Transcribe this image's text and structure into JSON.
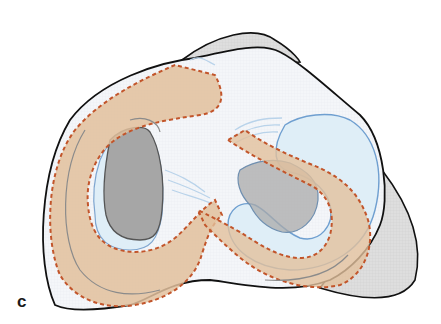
{
  "figure": {
    "panel_label": "c",
    "colors": {
      "background": "#ffffff",
      "plateau_fill": "#f3f6fa",
      "outline": "#111111",
      "posterior_shadow": "#dcdcdc",
      "meniscus_light_blue": "#dfeef7",
      "meniscus_blue_stroke": "#6f9fd0",
      "cartilage_grey": "#a8a8a8",
      "graft_tan": "#e2c09c",
      "graft_dashed_outline": "#c2552b"
    }
  }
}
